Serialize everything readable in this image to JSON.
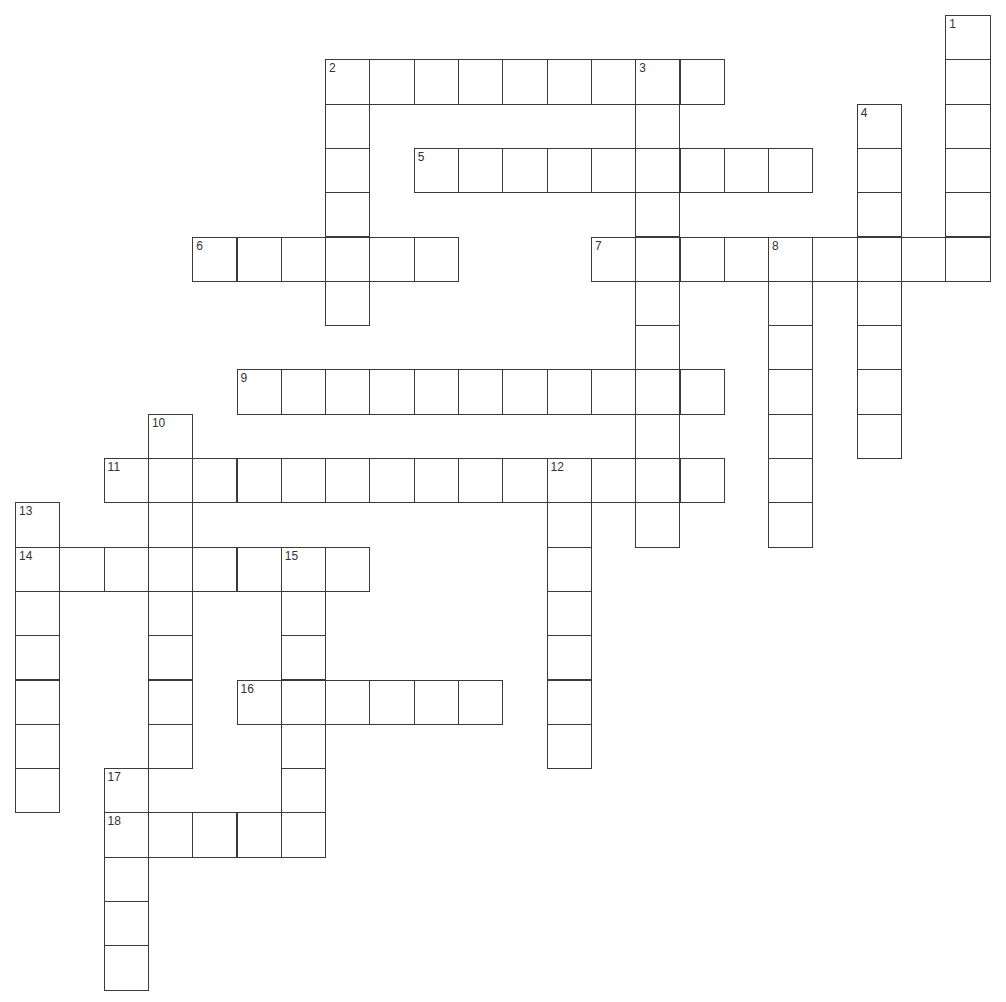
{
  "puzzle": {
    "cell_size": 44.3,
    "origin_x": 15,
    "origin_y": 15,
    "colors": {
      "line": "#3a3a3a",
      "background": "#ffffff",
      "number": "#333333"
    },
    "entries": [
      {
        "number": "1",
        "direction": "down",
        "col": 21,
        "row": 0,
        "length": 6
      },
      {
        "number": "2",
        "direction": "across",
        "col": 7,
        "row": 1,
        "length": 9
      },
      {
        "number": "2",
        "direction": "down",
        "col": 7,
        "row": 1,
        "length": 6
      },
      {
        "number": "3",
        "direction": "down",
        "col": 14,
        "row": 1,
        "length": 11
      },
      {
        "number": "4",
        "direction": "down",
        "col": 19,
        "row": 2,
        "length": 8
      },
      {
        "number": "5",
        "direction": "across",
        "col": 9,
        "row": 3,
        "length": 9
      },
      {
        "number": "6",
        "direction": "across",
        "col": 4,
        "row": 5,
        "length": 6
      },
      {
        "number": "7",
        "direction": "across",
        "col": 13,
        "row": 5,
        "length": 9
      },
      {
        "number": "8",
        "direction": "down",
        "col": 17,
        "row": 5,
        "length": 7
      },
      {
        "number": "9",
        "direction": "across",
        "col": 5,
        "row": 8,
        "length": 11
      },
      {
        "number": "10",
        "direction": "down",
        "col": 3,
        "row": 9,
        "length": 8
      },
      {
        "number": "11",
        "direction": "across",
        "col": 2,
        "row": 10,
        "length": 14
      },
      {
        "number": "12",
        "direction": "down",
        "col": 12,
        "row": 10,
        "length": 7
      },
      {
        "number": "13",
        "direction": "down",
        "col": 0,
        "row": 11,
        "length": 7
      },
      {
        "number": "14",
        "direction": "across",
        "col": 0,
        "row": 12,
        "length": 8
      },
      {
        "number": "15",
        "direction": "down",
        "col": 6,
        "row": 12,
        "length": 7
      },
      {
        "number": "16",
        "direction": "across",
        "col": 5,
        "row": 15,
        "length": 6
      },
      {
        "number": "17",
        "direction": "down",
        "col": 2,
        "row": 17,
        "length": 5
      },
      {
        "number": "18",
        "direction": "across",
        "col": 2,
        "row": 18,
        "length": 5
      }
    ]
  }
}
